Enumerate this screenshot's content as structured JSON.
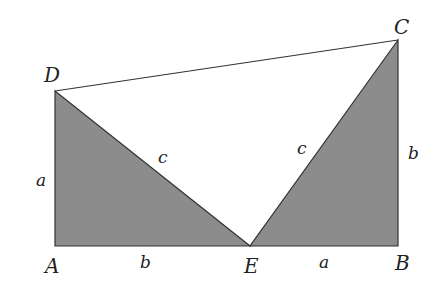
{
  "diagram": {
    "fill_color": "#8c8c8c",
    "stroke_color": "#333333",
    "points": {
      "A": {
        "label": "A",
        "x": 55,
        "y": 246
      },
      "B": {
        "label": "B",
        "x": 398,
        "y": 246
      },
      "C": {
        "label": "C",
        "x": 398,
        "y": 40
      },
      "D": {
        "label": "D",
        "x": 55,
        "y": 91
      },
      "E": {
        "label": "E",
        "x": 250,
        "y": 246
      }
    },
    "side_labels": {
      "AD": "a",
      "AE": "b",
      "DE": "c",
      "EC": "c",
      "EB": "a",
      "BC": "b"
    },
    "shaded_triangles": [
      "ADE",
      "EBC"
    ],
    "unshaded_triangle": "DEC"
  }
}
